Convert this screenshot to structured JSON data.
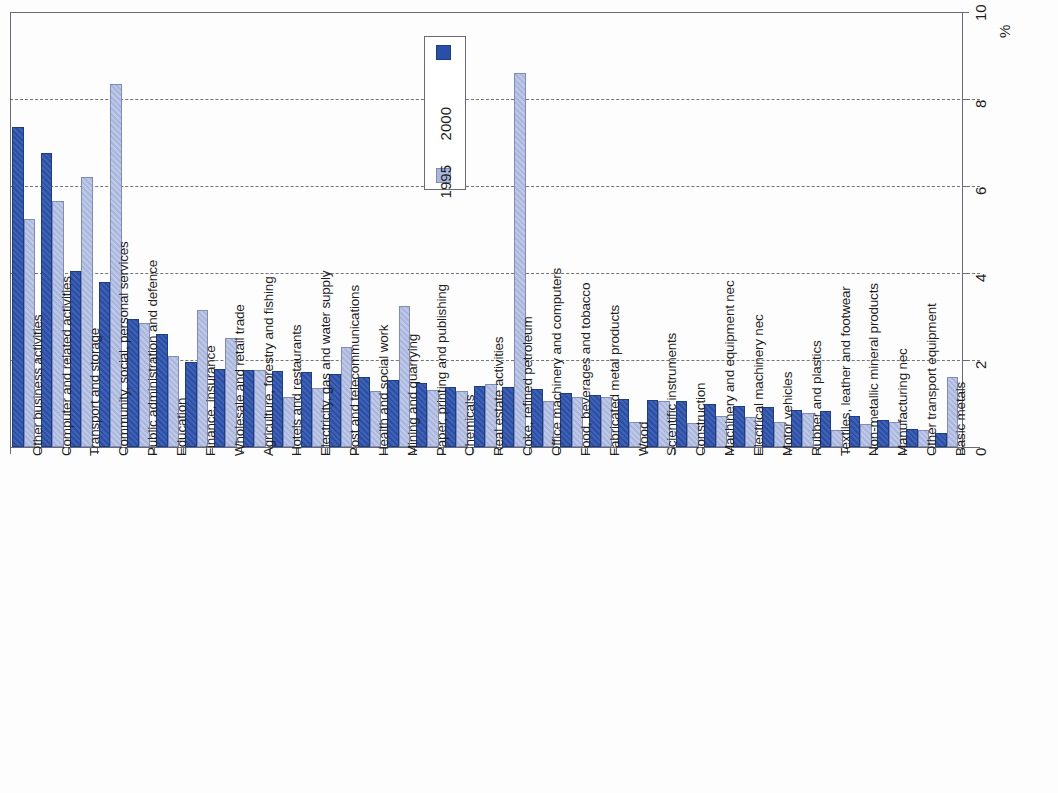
{
  "chart_data": {
    "type": "bar",
    "title": "",
    "xlabel": "",
    "ylabel": "%",
    "ylim": [
      0,
      10
    ],
    "yticks": [
      0,
      2,
      4,
      6,
      8,
      10
    ],
    "ytick_labels": [
      "0",
      "2",
      "4",
      "6",
      "8",
      "10"
    ],
    "grid": "horizontal dashed at 2, 4, 6, 8",
    "orientation": "vertical bars, page rotated 90 degrees (category labels read bottom-to-top, value axis on right)",
    "legend": {
      "position": "top-center inside plot",
      "entries": [
        {
          "name": "1995",
          "color": "#a9b6dd"
        },
        {
          "name": "2000",
          "color": "#2a4fa8"
        }
      ]
    },
    "categories": [
      "Other business activities",
      "Computer and related activities",
      "Transport and storage",
      "Community, social, personal services",
      "Public administration and defence",
      "Education",
      "Finance, insurance",
      "Wholesale and retail trade",
      "Agriculture, forestry and fishing",
      "Hotels and restaurants",
      "Electricity, gas and water supply",
      "Post and telecommunications",
      "Health and social work",
      "Mining and quarrying",
      "Paper, printing and publishing",
      "Chemicals",
      "Real estate activities",
      "Coke, refined petroleum",
      "Office machinery and computers",
      "Food, beverages and tobacco",
      "Fabricated metal products",
      "Wood",
      "Scientific instruments",
      "Construction",
      "Machinery and equipment nec",
      "Electrical machinery nec",
      "Motor vehicles",
      "Rubber and plastics",
      "Textiles, leather and footwear",
      "Non-metallic mineral products",
      "Manufacturing nec",
      "Other transport equipment",
      "Basic metals"
    ],
    "series": [
      {
        "name": "2000",
        "color": "#2a4fa8",
        "values": [
          7.35,
          6.75,
          4.05,
          3.8,
          2.95,
          2.6,
          1.95,
          1.8,
          1.78,
          1.75,
          1.72,
          1.68,
          1.6,
          1.55,
          1.48,
          1.38,
          1.4,
          1.38,
          1.34,
          1.25,
          1.2,
          1.1,
          1.08,
          1.05,
          1.0,
          0.95,
          0.92,
          0.85,
          0.82,
          0.72,
          0.62,
          0.42,
          0.32
        ]
      },
      {
        "name": "1995",
        "color": "#a9b6dd",
        "values": [
          5.25,
          5.65,
          6.2,
          8.35,
          2.85,
          2.1,
          3.15,
          2.5,
          1.78,
          1.15,
          1.35,
          2.3,
          1.28,
          3.25,
          1.3,
          1.28,
          1.45,
          8.6,
          1.05,
          1.15,
          1.15,
          0.58,
          1.05,
          0.55,
          0.72,
          0.68,
          0.58,
          0.78,
          0.38,
          0.52,
          0.58,
          0.4,
          1.62
        ]
      }
    ]
  },
  "axis": {
    "unit_label": "%"
  }
}
